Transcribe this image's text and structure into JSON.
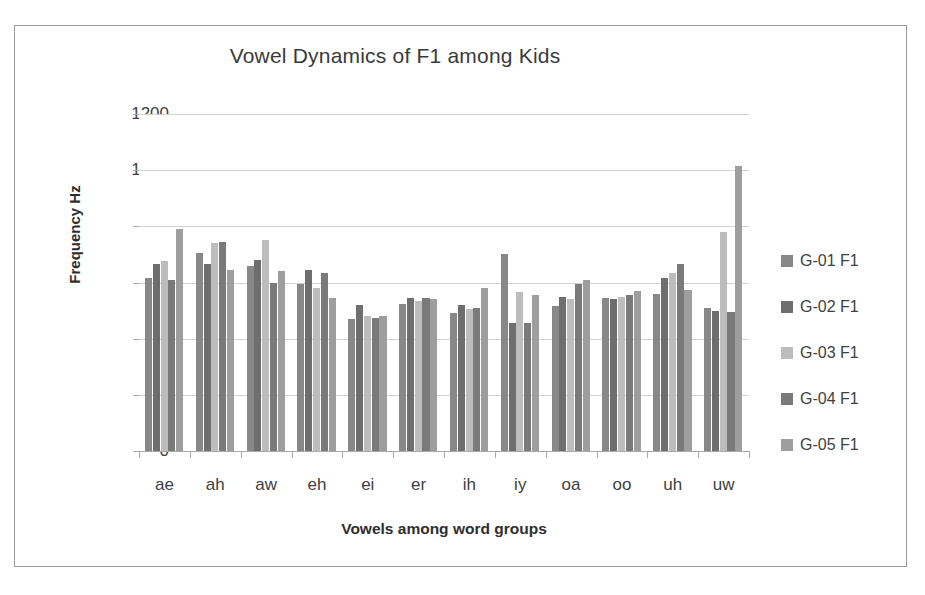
{
  "chart_data": {
    "type": "bar",
    "title": "Vowel Dynamics of F1 among Kids",
    "xlabel": "Vowels among word groups",
    "ylabel": "Frequency Hz",
    "ylim": [
      0,
      1200
    ],
    "ytick_step": 200,
    "yticks": [
      1200,
      1000,
      800,
      600,
      400,
      200,
      0
    ],
    "grid": true,
    "legend_position": "right",
    "categories": [
      "ae",
      "ah",
      "aw",
      "eh",
      "ei",
      "er",
      "ih",
      "iy",
      "oa",
      "oo",
      "uh",
      "uw"
    ],
    "series": [
      {
        "name": "G-01 F1",
        "color": "#888888",
        "values": [
          615,
          705,
          660,
          595,
          470,
          525,
          490,
          700,
          515,
          545,
          560,
          510
        ]
      },
      {
        "name": "G-02 F1",
        "color": "#6e6e6e",
        "values": [
          665,
          665,
          680,
          645,
          520,
          545,
          520,
          455,
          550,
          540,
          615,
          500
        ]
      },
      {
        "name": "G-03 F1",
        "color": "#bdbdbd",
        "values": [
          675,
          740,
          750,
          580,
          480,
          535,
          505,
          565,
          540,
          550,
          635,
          780
        ]
      },
      {
        "name": "G-04 F1",
        "color": "#7a7a7a",
        "values": [
          610,
          745,
          600,
          635,
          475,
          545,
          510,
          455,
          595,
          555,
          665,
          495
        ]
      },
      {
        "name": "G-05 F1",
        "color": "#9e9e9e",
        "values": [
          790,
          645,
          640,
          545,
          480,
          540,
          580,
          555,
          610,
          570,
          575,
          1015
        ]
      }
    ]
  },
  "legend": {
    "items": [
      {
        "label": "G-01 F1"
      },
      {
        "label": "G-02 F1"
      },
      {
        "label": "G-03 F1"
      },
      {
        "label": "G-04 F1"
      },
      {
        "label": "G-05 F1"
      }
    ]
  },
  "colors": {
    "border": "#9a9a9a",
    "gridline": "#d2d2d2",
    "axis": "#a8a8a8",
    "title_text": "#3a3a3a",
    "tick_text": "#3f3f3f",
    "axis_title_text": "#2e2e2e",
    "background": "#ffffff"
  }
}
